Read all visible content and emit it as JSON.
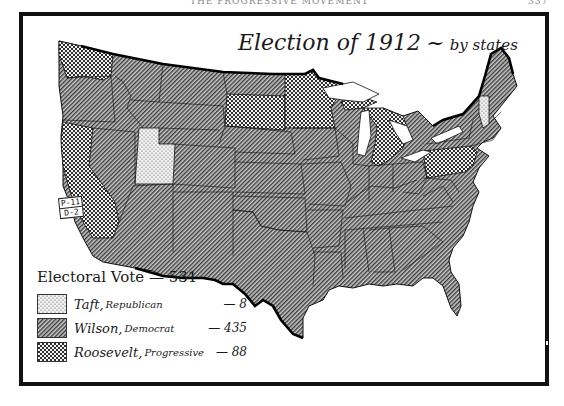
{
  "running_head": {
    "title": "THE PROGRESSIVE MOVEMENT",
    "page": "337"
  },
  "map": {
    "title": "Election of 1912",
    "title_separator": "~",
    "subtitle": "by states",
    "legend": {
      "heading": "Electoral Vote — 531",
      "total": 531,
      "entries": [
        {
          "candidate": "Taft",
          "party": "Republican",
          "votes": "— 8",
          "pattern": "dots"
        },
        {
          "candidate": "Wilson",
          "party": "Democrat",
          "votes": "— 435",
          "pattern": "diagonal-lines"
        },
        {
          "candidate": "Roosevelt",
          "party": "Progressive",
          "votes": "— 88",
          "pattern": "checker"
        }
      ]
    },
    "split_state_label": {
      "state": "California",
      "line1": "P-11",
      "line2": "D-2"
    },
    "states_by_winner": {
      "Taft": [
        "Utah",
        "Vermont"
      ],
      "Roosevelt": [
        "Washington",
        "California",
        "South Dakota",
        "Minnesota",
        "Michigan",
        "Pennsylvania"
      ],
      "Wilson": [
        "All other states"
      ]
    },
    "colors": {
      "ink": "#111111",
      "fill_base": "#ffffff",
      "hatch_dark": "#2a2a2a",
      "water": "#ffffff"
    }
  }
}
